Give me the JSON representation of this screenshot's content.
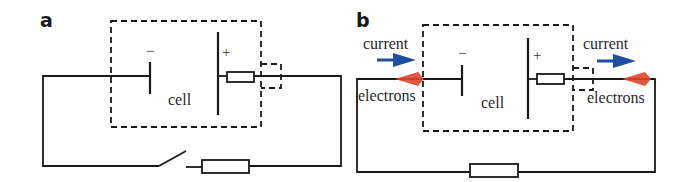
{
  "figure": {
    "panels": [
      {
        "id": "a",
        "label": "a",
        "cell_label": "cell",
        "negative_sign": "−",
        "positive_sign": "+",
        "components": [
          "cell (internal resistance)",
          "switch (open)",
          "external resistor"
        ]
      },
      {
        "id": "b",
        "label": "b",
        "cell_label": "cell",
        "negative_sign": "−",
        "positive_sign": "+",
        "left_current_label": "current",
        "left_electrons_label": "electrons",
        "right_current_label": "current",
        "right_electrons_label": "electrons",
        "components": [
          "cell (internal resistance)",
          "external resistor"
        ]
      }
    ],
    "colors": {
      "current_arrow": "#1f4fa0",
      "electron_arrow": "#e0442a",
      "line": "#1a1a1a"
    }
  }
}
